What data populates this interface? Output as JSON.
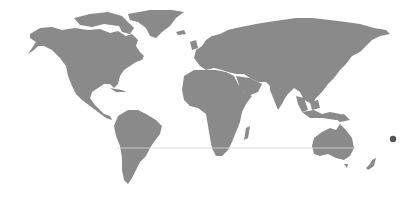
{
  "map": {
    "type": "world-map",
    "land_color": "#8a8a8a",
    "background_color": "#ffffff",
    "markers": [
      {
        "name": "pacific-marker",
        "x": 393,
        "y": 139,
        "radius": 3.2,
        "color": "#555555"
      }
    ]
  }
}
